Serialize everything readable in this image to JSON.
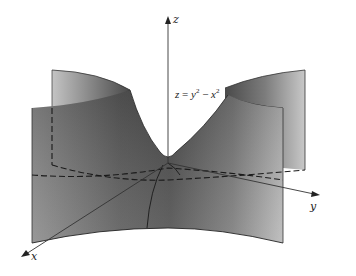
{
  "figure": {
    "equation": {
      "lhs": "z",
      "eq": " = ",
      "y": "y",
      "sup1": "2",
      "minus": " − ",
      "x": "x",
      "sup2": "2"
    },
    "axes": {
      "x_label": "x",
      "y_label": "y",
      "z_label": "z"
    },
    "colors": {
      "surface_dark": "#3a3a3a",
      "surface_mid": "#6e6e6e",
      "surface_light": "#bdbdbd",
      "edge": "#222222",
      "axis": "#333333"
    }
  }
}
